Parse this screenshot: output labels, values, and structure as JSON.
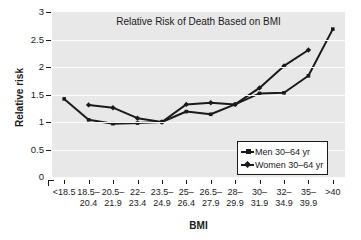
{
  "chart_data": {
    "type": "line",
    "title": "Relative Risk of Death Based on BMI",
    "xlabel": "BMI",
    "ylabel": "Relative risk",
    "ylim": [
      0,
      3
    ],
    "yticks": [
      "0",
      "0.5",
      "1",
      "1.5",
      "2",
      "2.5",
      "3"
    ],
    "ytick_values": [
      0,
      0.5,
      1,
      1.5,
      2,
      2.5,
      3
    ],
    "grid": true,
    "legend_position": "lower-right",
    "categories": [
      "<18.5",
      "18.5–\n20.4",
      "20.5–\n21.9",
      "22–\n23.4",
      "23.5–\n24.9",
      "25–\n26.4",
      "26.5–\n27.9",
      "28–\n29.9",
      "30–\n31.9",
      "32–\n34.9",
      "35–\n39.9",
      ">40"
    ],
    "series": [
      {
        "name": "Men 30–64 yr",
        "marker": "square",
        "color": "#1a1a1a",
        "values": [
          1.42,
          1.04,
          0.97,
          0.98,
          1.0,
          1.19,
          1.14,
          1.32,
          1.52,
          1.53,
          1.84,
          2.69
        ]
      },
      {
        "name": "Women 30–64 yr",
        "marker": "diamond",
        "color": "#1a1a1a",
        "values": [
          null,
          1.31,
          1.26,
          1.07,
          1.0,
          1.32,
          1.35,
          1.32,
          1.62,
          2.02,
          2.31,
          null
        ]
      }
    ]
  },
  "legend": {
    "items": [
      {
        "label": "Men 30–64 yr",
        "marker": "square"
      },
      {
        "label": "Women 30–64 yr",
        "marker": "diamond"
      }
    ]
  },
  "colors": {
    "plot_background": "#e8e8e8",
    "gridline": "#fcfcfc",
    "ink": "#1a1a1a",
    "page_background": "#ffffff"
  }
}
